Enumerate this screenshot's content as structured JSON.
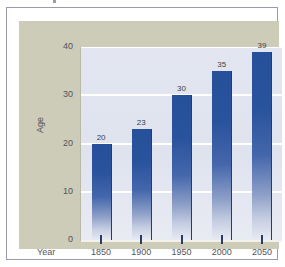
{
  "chart_data": {
    "type": "bar",
    "title": "",
    "categories": [
      "1850",
      "1900",
      "1950",
      "2000",
      "2050"
    ],
    "values": [
      20,
      23,
      30,
      35,
      39
    ],
    "xlabel": "Year",
    "ylabel": "Age",
    "ylim": [
      0,
      40
    ],
    "yticks": [
      "0",
      "10",
      "20",
      "30",
      "40"
    ],
    "ytick_values": [
      0,
      10,
      20,
      30,
      40
    ],
    "grid": "horizontal",
    "legend": "none",
    "data_labels": [
      "20",
      "23",
      "30",
      "35",
      "39"
    ],
    "series": [
      {
        "name": "Age",
        "values": [
          20,
          23,
          30,
          35,
          39
        ]
      }
    ],
    "colors": {
      "bar_top": "#27509b",
      "bar_bottom": "#e8ebf3",
      "bar_edge": "#2b3c63",
      "plot_background": "#dfe3ee",
      "gridline": "#ffffff",
      "panel_background": "#ccccb8",
      "frame_border": "#9a9aae",
      "label_text": "#53535c",
      "value_text": "#3c3c46"
    }
  }
}
